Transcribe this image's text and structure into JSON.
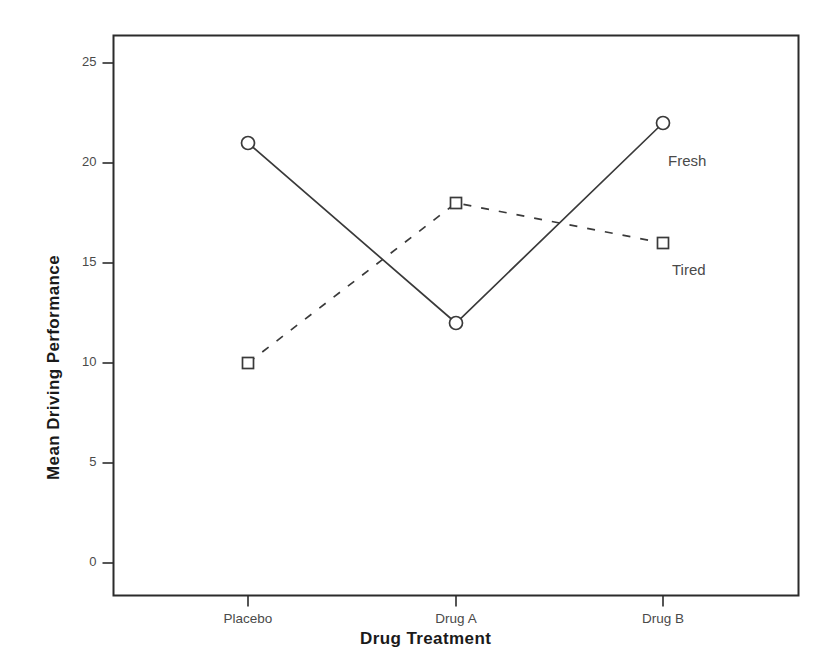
{
  "chart_data": {
    "type": "line",
    "title": "",
    "xlabel": "Drug Treatment",
    "ylabel": "Mean Driving Performance",
    "categories": [
      "Placebo",
      "Drug A",
      "Drug B"
    ],
    "series": [
      {
        "name": "Fresh",
        "values": [
          21,
          12,
          22
        ],
        "line_style": "solid",
        "marker": "circle",
        "color": "#3a3a3a"
      },
      {
        "name": "Tired",
        "values": [
          10,
          18,
          16
        ],
        "line_style": "dashed",
        "marker": "square",
        "color": "#3a3a3a"
      }
    ],
    "ylim": [
      0,
      26.5
    ],
    "y_ticks": [
      0,
      5,
      10,
      15,
      20,
      25
    ],
    "y_tick_labels": [
      "0",
      "5",
      "10",
      "15",
      "20",
      "25"
    ],
    "x_tick_labels": [
      "Placebo",
      "Drug A",
      "Drug B"
    ],
    "grid": false,
    "legend_position": "inline-right",
    "annotations": [
      {
        "text": "Fresh",
        "series": "Fresh"
      },
      {
        "text": "Tired",
        "series": "Tired"
      }
    ],
    "frame": true,
    "background_color": "#ffffff",
    "axis_color": "#2b2b2b"
  }
}
